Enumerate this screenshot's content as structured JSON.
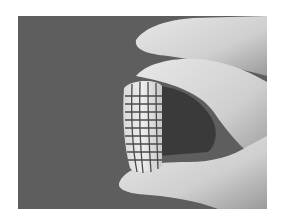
{
  "image": {
    "description": "Grayscale photograph of a hand holding a small curved flexible sheet with a grid pattern between thumb and fingers against a dark gray background",
    "colors": {
      "page_background": "#ffffff",
      "photo_background": "#5f5f5f",
      "skin": "#d8d8d8",
      "skin_shadow": "#a9a9a9",
      "grid_sheet": "#e6e6e6",
      "grid_lines": "#4a4a4a"
    },
    "grid": {
      "columns": 4,
      "rows": 10
    }
  }
}
